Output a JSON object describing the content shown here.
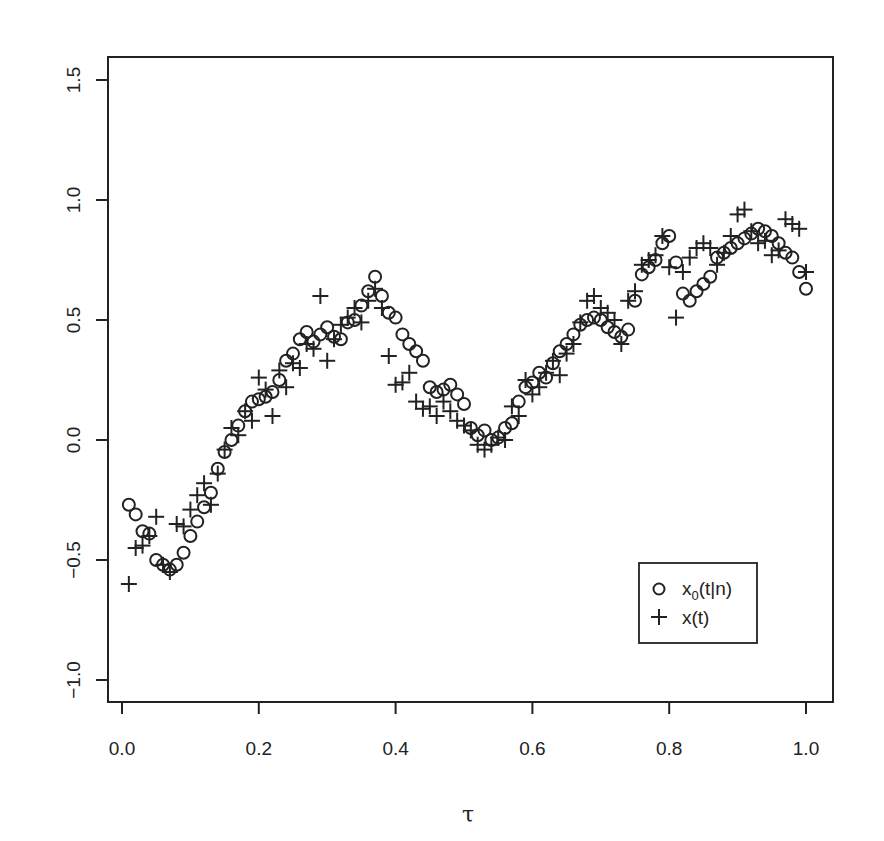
{
  "chart_data": {
    "type": "scatter",
    "title": "",
    "xlabel": "τ",
    "ylabel": "",
    "xlim": [
      -0.02,
      1.04
    ],
    "ylim": [
      -1.09,
      1.6
    ],
    "xticks": [
      0.0,
      0.2,
      0.4,
      0.6,
      0.8,
      1.0
    ],
    "xtick_labels": [
      "0.0",
      "0.2",
      "0.4",
      "0.6",
      "0.8",
      "1.0"
    ],
    "yticks": [
      -1.0,
      -0.5,
      0.0,
      0.5,
      1.0,
      1.5
    ],
    "ytick_labels": [
      "-1.0",
      "-0.5",
      "0.0",
      "0.5",
      "1.0",
      "1.5"
    ],
    "grid": false,
    "legend_position": "bottom-right",
    "legend": [
      {
        "symbol": "circle",
        "label_main": "x",
        "label_sub": "0",
        "label_rest": "(t|n)"
      },
      {
        "symbol": "plus",
        "label_main": "x",
        "label_sub": "",
        "label_rest": "(t)"
      }
    ],
    "series": [
      {
        "name": "x0(t|n)",
        "marker": "circle",
        "x": [
          0.01,
          0.02,
          0.03,
          0.04,
          0.05,
          0.06,
          0.07,
          0.08,
          0.09,
          0.1,
          0.11,
          0.12,
          0.13,
          0.14,
          0.15,
          0.16,
          0.17,
          0.18,
          0.19,
          0.2,
          0.21,
          0.22,
          0.23,
          0.24,
          0.25,
          0.26,
          0.27,
          0.28,
          0.29,
          0.3,
          0.31,
          0.32,
          0.33,
          0.34,
          0.35,
          0.36,
          0.37,
          0.38,
          0.39,
          0.4,
          0.41,
          0.42,
          0.43,
          0.44,
          0.45,
          0.46,
          0.47,
          0.48,
          0.49,
          0.5,
          0.51,
          0.52,
          0.53,
          0.54,
          0.55,
          0.56,
          0.57,
          0.58,
          0.59,
          0.6,
          0.61,
          0.62,
          0.63,
          0.64,
          0.65,
          0.66,
          0.67,
          0.68,
          0.69,
          0.7,
          0.71,
          0.72,
          0.73,
          0.74,
          0.75,
          0.76,
          0.77,
          0.78,
          0.79,
          0.8,
          0.81,
          0.82,
          0.83,
          0.84,
          0.85,
          0.86,
          0.87,
          0.88,
          0.89,
          0.9,
          0.91,
          0.92,
          0.93,
          0.94,
          0.95,
          0.96,
          0.97,
          0.98,
          0.99,
          1.0
        ],
        "values": [
          -0.27,
          -0.31,
          -0.38,
          -0.39,
          -0.5,
          -0.52,
          -0.54,
          -0.52,
          -0.47,
          -0.4,
          -0.34,
          -0.28,
          -0.22,
          -0.12,
          -0.05,
          0.0,
          0.06,
          0.12,
          0.16,
          0.17,
          0.18,
          0.2,
          0.25,
          0.33,
          0.36,
          0.42,
          0.45,
          0.41,
          0.44,
          0.47,
          0.43,
          0.42,
          0.49,
          0.5,
          0.56,
          0.62,
          0.68,
          0.6,
          0.53,
          0.51,
          0.44,
          0.4,
          0.37,
          0.33,
          0.22,
          0.2,
          0.21,
          0.23,
          0.19,
          0.15,
          0.05,
          0.02,
          0.04,
          0.0,
          0.01,
          0.05,
          0.07,
          0.16,
          0.22,
          0.24,
          0.28,
          0.26,
          0.32,
          0.37,
          0.4,
          0.44,
          0.48,
          0.5,
          0.51,
          0.5,
          0.47,
          0.45,
          0.43,
          0.46,
          0.58,
          0.69,
          0.72,
          0.75,
          0.82,
          0.85,
          0.74,
          0.61,
          0.58,
          0.62,
          0.65,
          0.68,
          0.76,
          0.78,
          0.8,
          0.82,
          0.84,
          0.86,
          0.88,
          0.87,
          0.85,
          0.82,
          0.78,
          0.76,
          0.7,
          0.63
        ]
      },
      {
        "name": "x(t)",
        "marker": "plus",
        "x": [
          0.01,
          0.02,
          0.03,
          0.04,
          0.05,
          0.06,
          0.07,
          0.08,
          0.09,
          0.1,
          0.11,
          0.12,
          0.13,
          0.14,
          0.15,
          0.16,
          0.17,
          0.18,
          0.19,
          0.2,
          0.21,
          0.22,
          0.23,
          0.24,
          0.25,
          0.26,
          0.27,
          0.28,
          0.29,
          0.3,
          0.31,
          0.32,
          0.33,
          0.34,
          0.35,
          0.36,
          0.37,
          0.38,
          0.39,
          0.4,
          0.41,
          0.42,
          0.43,
          0.44,
          0.45,
          0.46,
          0.47,
          0.48,
          0.49,
          0.5,
          0.51,
          0.52,
          0.53,
          0.54,
          0.55,
          0.56,
          0.57,
          0.58,
          0.59,
          0.6,
          0.61,
          0.62,
          0.63,
          0.64,
          0.65,
          0.66,
          0.67,
          0.68,
          0.69,
          0.7,
          0.71,
          0.72,
          0.73,
          0.74,
          0.75,
          0.76,
          0.77,
          0.78,
          0.79,
          0.8,
          0.81,
          0.82,
          0.83,
          0.84,
          0.85,
          0.86,
          0.87,
          0.88,
          0.89,
          0.9,
          0.91,
          0.92,
          0.93,
          0.94,
          0.95,
          0.96,
          0.97,
          0.98,
          0.99,
          1.0
        ],
        "values": [
          -0.6,
          -0.45,
          -0.44,
          -0.4,
          -0.32,
          -0.52,
          -0.55,
          -0.35,
          -0.36,
          -0.29,
          -0.23,
          -0.18,
          -0.27,
          -0.14,
          -0.04,
          0.05,
          0.02,
          0.12,
          0.08,
          0.26,
          0.21,
          0.1,
          0.29,
          0.22,
          0.32,
          0.3,
          0.4,
          0.38,
          0.6,
          0.33,
          0.42,
          0.48,
          0.51,
          0.55,
          0.49,
          0.58,
          0.63,
          0.55,
          0.35,
          0.23,
          0.24,
          0.28,
          0.16,
          0.13,
          0.14,
          0.1,
          0.16,
          0.12,
          0.08,
          0.06,
          0.04,
          -0.02,
          -0.04,
          -0.02,
          0.01,
          0.0,
          0.14,
          0.1,
          0.25,
          0.19,
          0.22,
          0.28,
          0.33,
          0.27,
          0.36,
          0.4,
          0.49,
          0.58,
          0.6,
          0.55,
          0.53,
          0.5,
          0.4,
          0.58,
          0.62,
          0.73,
          0.75,
          0.77,
          0.85,
          0.72,
          0.51,
          0.7,
          0.76,
          0.8,
          0.82,
          0.8,
          0.73,
          0.78,
          0.85,
          0.94,
          0.96,
          0.87,
          0.82,
          0.83,
          0.77,
          0.79,
          0.92,
          0.9,
          0.88,
          0.7
        ]
      }
    ]
  }
}
